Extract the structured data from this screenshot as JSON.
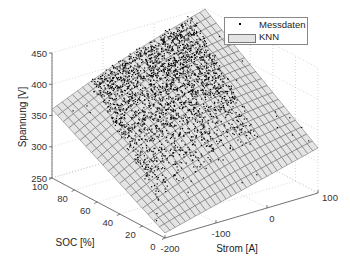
{
  "chart_data": {
    "type": "scatter3d+surface",
    "title": "",
    "xlabel": "Strom [A]",
    "ylabel": "SOC [%]",
    "zlabel": "Spannung [V]",
    "xlim": [
      -200,
      100
    ],
    "ylim": [
      0,
      100
    ],
    "zlim": [
      250,
      450
    ],
    "xticks": [
      -200,
      -100,
      0,
      100
    ],
    "yticks": [
      0,
      20,
      40,
      60,
      80,
      100
    ],
    "zticks": [
      250,
      300,
      350,
      400,
      450
    ],
    "grid": true,
    "legend_position": "top-right",
    "series": [
      {
        "name": "Messdaten",
        "kind": "scatter",
        "marker": "dot",
        "color": "#000000",
        "description": "dense cloud of measured points mostly over SOC 20-100 and current -150..100, voltage ~300-440 V"
      },
      {
        "name": "KNN",
        "kind": "surface",
        "color": "#e4e4e4",
        "edge_color": "#555555",
        "corners": [
          {
            "strom": -200,
            "soc": 100,
            "spannung": 360
          },
          {
            "strom": 100,
            "soc": 100,
            "spannung": 448
          },
          {
            "strom": 100,
            "soc": 0,
            "spannung": 322
          },
          {
            "strom": -200,
            "soc": 0,
            "spannung": 258
          }
        ]
      }
    ]
  },
  "legend": {
    "items": [
      {
        "label": "Messdaten"
      },
      {
        "label": "KNN"
      }
    ]
  },
  "axes": {
    "x_label": "Strom [A]",
    "y_label": "SOC [%]",
    "z_label": "Spannung [V]",
    "x_ticks": [
      "-200",
      "-100",
      "0",
      "100"
    ],
    "y_ticks": [
      "0",
      "20",
      "40",
      "60",
      "80",
      "100"
    ],
    "z_ticks": [
      "250",
      "300",
      "350",
      "400",
      "450"
    ]
  }
}
